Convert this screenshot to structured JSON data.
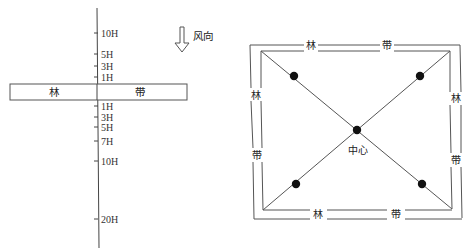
{
  "left_diagram": {
    "title_hint": "shelterbelt profile with distances in tree heights",
    "belt": {
      "left_label": "林",
      "right_label": "带"
    },
    "wind": {
      "label": "风向",
      "direction": "down"
    },
    "ticks_upwind": [
      {
        "label": "10H",
        "y": 33
      },
      {
        "label": "5H",
        "y": 54
      },
      {
        "label": "3H",
        "y": 66
      },
      {
        "label": "1H",
        "y": 77
      }
    ],
    "ticks_downwind": [
      {
        "label": "1H",
        "y": 106
      },
      {
        "label": "3H",
        "y": 117
      },
      {
        "label": "5H",
        "y": 127
      },
      {
        "label": "7H",
        "y": 141
      },
      {
        "label": "10H",
        "y": 161
      },
      {
        "label": "20H",
        "y": 219
      }
    ]
  },
  "right_diagram": {
    "top_labels": [
      "林",
      "带"
    ],
    "bottom_labels": [
      "林",
      "带"
    ],
    "left_labels": [
      "林",
      "带"
    ],
    "right_labels": [
      "林",
      "带"
    ],
    "center_label": "中心",
    "points": [
      {
        "name": "top-left",
        "x": 294,
        "y": 76
      },
      {
        "name": "top-right",
        "x": 420,
        "y": 76
      },
      {
        "name": "center",
        "x": 357,
        "y": 130
      },
      {
        "name": "bottom-left",
        "x": 296,
        "y": 184
      },
      {
        "name": "bottom-right",
        "x": 422,
        "y": 184
      }
    ]
  }
}
